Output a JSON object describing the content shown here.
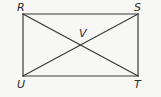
{
  "figure": {
    "type": "rectangle-with-diagonals",
    "background_color": "#f7f7f5",
    "stroke_color": "#3a3a3a",
    "label_color": "#2b2b2b",
    "rectangle": {
      "left": 23,
      "top": 14,
      "right": 138,
      "bottom": 76,
      "width": 115,
      "height": 62
    },
    "vertices": [
      {
        "id": "R",
        "label": "R",
        "position": "top-left",
        "x": 23,
        "y": 14
      },
      {
        "id": "S",
        "label": "S",
        "position": "top-right",
        "x": 138,
        "y": 14
      },
      {
        "id": "T",
        "label": "T",
        "position": "bottom-right",
        "x": 138,
        "y": 76
      },
      {
        "id": "U",
        "label": "U",
        "position": "bottom-left",
        "x": 23,
        "y": 76
      }
    ],
    "intersection": {
      "id": "V",
      "label": "V",
      "x": 80.5,
      "y": 45
    },
    "segments": [
      {
        "name": "side-RS",
        "from": "R",
        "to": "S"
      },
      {
        "name": "side-ST",
        "from": "S",
        "to": "T"
      },
      {
        "name": "side-TU",
        "from": "T",
        "to": "U"
      },
      {
        "name": "side-UR",
        "from": "U",
        "to": "R"
      },
      {
        "name": "diagonal-RT",
        "from": "R",
        "to": "T"
      },
      {
        "name": "diagonal-SU",
        "from": "S",
        "to": "U"
      }
    ]
  }
}
